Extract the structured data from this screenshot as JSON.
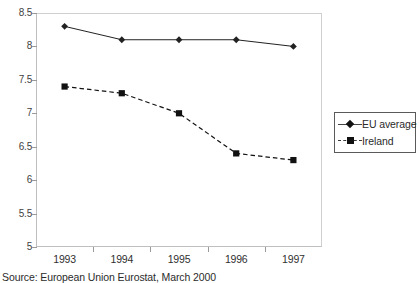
{
  "chart_data": {
    "type": "line",
    "title": "",
    "xlabel": "",
    "ylabel": "",
    "categories": [
      "1993",
      "1994",
      "1995",
      "1996",
      "1997"
    ],
    "series": [
      {
        "name": "EU average",
        "values": [
          8.3,
          8.1,
          8.1,
          8.1,
          8.0
        ],
        "marker": "diamond",
        "line_style": "solid",
        "color": "#222222"
      },
      {
        "name": "Ireland",
        "values": [
          7.4,
          7.3,
          7.0,
          6.4,
          6.3
        ],
        "marker": "square",
        "line_style": "dashed",
        "color": "#111111"
      }
    ],
    "ylim": [
      5,
      8.5
    ],
    "ytick_values": [
      8.5,
      8,
      7.5,
      7,
      6.5,
      6,
      5.5,
      5
    ],
    "ytick_labels": [
      "8.5",
      "8",
      "7.5",
      "7",
      "6.5",
      "6",
      "5.5",
      "5"
    ],
    "grid": false,
    "legend_position": "right"
  },
  "legend": {
    "entries": [
      {
        "label": "EU average"
      },
      {
        "label": "Ireland"
      }
    ]
  },
  "caption": {
    "text": "Source: European Union Eurostat, March 2000"
  },
  "colors": {
    "axis": "#bfbfbf",
    "tick": "#9a9a9a",
    "text": "#2f2f2f",
    "eu_series": "#222222",
    "ireland_series": "#111111",
    "background": "#ffffff"
  }
}
